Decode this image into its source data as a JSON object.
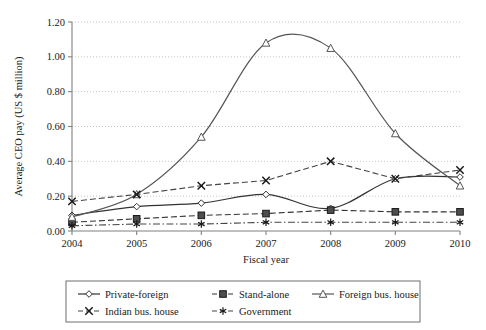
{
  "chart_data": {
    "type": "line",
    "title": "",
    "xlabel": "Fiscal year",
    "ylabel": "Average CEO pay (US $ million)",
    "categories": [
      "2004",
      "2005",
      "2006",
      "2007",
      "2008",
      "2009",
      "2010"
    ],
    "x": [
      2004,
      2005,
      2006,
      2007,
      2008,
      2009,
      2010
    ],
    "xlim": [
      2004,
      2010
    ],
    "ylim": [
      0.0,
      1.2
    ],
    "yticks": [
      "0.00",
      "0.20",
      "0.40",
      "0.60",
      "0.80",
      "1.00",
      "1.20"
    ],
    "ytick_values": [
      0.0,
      0.2,
      0.4,
      0.6,
      0.8,
      1.0,
      1.2
    ],
    "grid": "horizontal-dotted",
    "legend_position": "bottom",
    "series": [
      {
        "name": "Private-foreign",
        "marker": "diamond-open",
        "line": "solid",
        "color": "#333333",
        "values": [
          0.09,
          0.14,
          0.16,
          0.21,
          0.13,
          0.3,
          0.31
        ]
      },
      {
        "name": "Stand-alone",
        "marker": "square-filled",
        "line": "dashed",
        "color": "#333333",
        "values": [
          0.05,
          0.07,
          0.09,
          0.1,
          0.12,
          0.11,
          0.11
        ]
      },
      {
        "name": "Foreign bus. house",
        "marker": "triangle-open",
        "line": "solid",
        "color": "#555555",
        "values": [
          0.08,
          0.21,
          0.54,
          1.08,
          1.05,
          0.56,
          0.26
        ]
      },
      {
        "name": "Indian bus. house",
        "marker": "cross-x",
        "line": "dashed",
        "color": "#444444",
        "values": [
          0.17,
          0.21,
          0.26,
          0.29,
          0.4,
          0.3,
          0.35
        ]
      },
      {
        "name": "Government",
        "marker": "asterisk",
        "line": "dash-dot",
        "color": "#444444",
        "values": [
          0.03,
          0.04,
          0.04,
          0.05,
          0.05,
          0.05,
          0.05
        ]
      }
    ]
  },
  "legend": {
    "items": [
      {
        "label": "Private-foreign"
      },
      {
        "label": "Stand-alone"
      },
      {
        "label": "Foreign bus. house"
      },
      {
        "label": "Indian bus. house"
      },
      {
        "label": "Government"
      }
    ]
  }
}
